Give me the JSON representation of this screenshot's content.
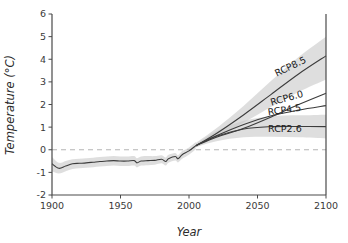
{
  "chart_data": {
    "type": "line",
    "title": "",
    "xlabel": "Year",
    "ylabel": "Temperature (°C)",
    "xlim": [
      1900,
      2100
    ],
    "ylim": [
      -2,
      6
    ],
    "xticks": [
      1900,
      1950,
      2000,
      2050,
      2100
    ],
    "yticks": [
      -2,
      -1,
      0,
      1,
      2,
      3,
      4,
      5,
      6
    ],
    "grid": false,
    "legend_position": "inline-end-of-line",
    "reference_line": {
      "y": 0,
      "style": "dashed",
      "color": "#b4b4b4"
    },
    "band_color": "#c9c9c9",
    "line_color": "#3c3c3c",
    "annotations": [
      {
        "text": "RCP8.5",
        "x": 2075,
        "y": 3.55,
        "rotation": -26
      },
      {
        "text": "RCP6.0",
        "x": 2072,
        "y": 2.15,
        "rotation": -16
      },
      {
        "text": "RCP4.5",
        "x": 2070,
        "y": 1.62,
        "rotation": -8
      },
      {
        "text": "RCP2.6",
        "x": 2070,
        "y": 0.78,
        "rotation": 0
      }
    ],
    "series": [
      {
        "name": "historical",
        "x": [
          1900,
          1905,
          1910,
          1915,
          1920,
          1925,
          1930,
          1935,
          1940,
          1945,
          1950,
          1955,
          1960,
          1962,
          1965,
          1970,
          1975,
          1980,
          1983,
          1985,
          1990,
          1992,
          1995,
          2000,
          2005
        ],
        "values": [
          -0.62,
          -0.82,
          -0.72,
          -0.62,
          -0.6,
          -0.58,
          -0.55,
          -0.52,
          -0.5,
          -0.48,
          -0.5,
          -0.5,
          -0.48,
          -0.58,
          -0.5,
          -0.48,
          -0.47,
          -0.42,
          -0.52,
          -0.4,
          -0.3,
          -0.4,
          -0.22,
          -0.05,
          0.18
        ],
        "band_lower": [
          -0.95,
          -1.05,
          -0.95,
          -0.85,
          -0.82,
          -0.8,
          -0.77,
          -0.74,
          -0.72,
          -0.7,
          -0.72,
          -0.72,
          -0.7,
          -0.78,
          -0.7,
          -0.68,
          -0.66,
          -0.6,
          -0.7,
          -0.58,
          -0.48,
          -0.56,
          -0.4,
          -0.22,
          0.02
        ],
        "band_upper": [
          -0.32,
          -0.58,
          -0.5,
          -0.42,
          -0.4,
          -0.38,
          -0.35,
          -0.32,
          -0.3,
          -0.28,
          -0.3,
          -0.3,
          -0.28,
          -0.38,
          -0.3,
          -0.28,
          -0.28,
          -0.24,
          -0.34,
          -0.22,
          -0.14,
          -0.24,
          -0.06,
          0.1,
          0.34
        ]
      },
      {
        "name": "RCP8.5",
        "x": [
          2005,
          2020,
          2040,
          2060,
          2080,
          2100
        ],
        "values": [
          0.18,
          0.72,
          1.55,
          2.45,
          3.35,
          4.15
        ],
        "band_lower": [
          0.1,
          0.55,
          1.2,
          1.9,
          2.55,
          3.1
        ],
        "band_upper": [
          0.3,
          0.95,
          1.95,
          3.05,
          4.1,
          5.0
        ]
      },
      {
        "name": "RCP6.0",
        "x": [
          2005,
          2020,
          2040,
          2060,
          2080,
          2100
        ],
        "values": [
          0.18,
          0.55,
          0.95,
          1.45,
          2.0,
          2.5
        ]
      },
      {
        "name": "RCP4.5",
        "x": [
          2005,
          2020,
          2040,
          2060,
          2080,
          2100
        ],
        "values": [
          0.18,
          0.62,
          1.12,
          1.5,
          1.75,
          1.95
        ]
      },
      {
        "name": "RCP2.6",
        "x": [
          2005,
          2020,
          2040,
          2060,
          2080,
          2100
        ],
        "values": [
          0.18,
          0.6,
          0.92,
          1.02,
          1.03,
          1.02
        ],
        "band_lower": [
          0.12,
          0.38,
          0.55,
          0.58,
          0.55,
          0.5
        ],
        "band_upper": [
          0.26,
          0.82,
          1.28,
          1.48,
          1.52,
          1.55
        ]
      }
    ]
  }
}
